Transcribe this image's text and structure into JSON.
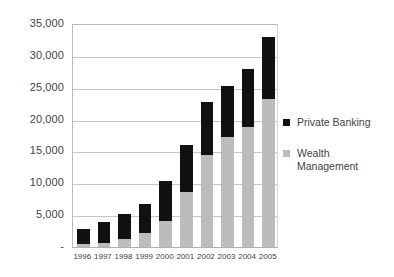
{
  "chart_data": {
    "type": "bar",
    "stacked": true,
    "title": "",
    "subtitle": "",
    "xlabel": "",
    "ylabel": "",
    "categories": [
      "1996",
      "1997",
      "1998",
      "1999",
      "2000",
      "2001",
      "2002",
      "2003",
      "2004",
      "2005"
    ],
    "series": [
      {
        "name": "Wealth Management",
        "color": "#bcbcbc",
        "values": [
          500,
          700,
          1300,
          2200,
          4100,
          8700,
          14500,
          17200,
          18900,
          23300
        ]
      },
      {
        "name": "Private Banking",
        "color": "#111111",
        "values": [
          2400,
          3200,
          3900,
          4600,
          6200,
          7300,
          8200,
          8100,
          9100,
          9700
        ]
      }
    ],
    "totals": [
      2900,
      3900,
      5200,
      6800,
      10300,
      16000,
      22700,
      25300,
      28000,
      33000
    ],
    "ylim": [
      0,
      35000
    ],
    "ytick_values": [
      0,
      5000,
      10000,
      15000,
      20000,
      25000,
      30000,
      35000
    ],
    "ytick_labels": [
      "-",
      "5,000",
      "10,000",
      "15,000",
      "20,000",
      "25,000",
      "30,000",
      "35,000"
    ],
    "grid": true,
    "legend_position": "right"
  },
  "legend": {
    "entries": [
      {
        "label": "Private Banking",
        "lines": [
          "Private Banking"
        ],
        "swatch": "#111111"
      },
      {
        "label": "Wealth Management",
        "lines": [
          "Wealth",
          "Management"
        ],
        "swatch": "#bcbcbc"
      }
    ]
  }
}
